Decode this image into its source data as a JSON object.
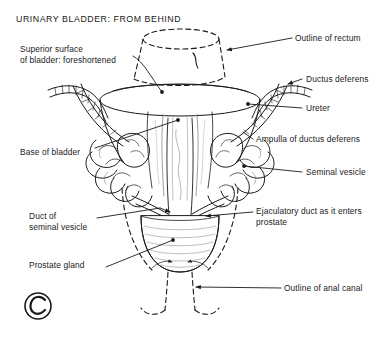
{
  "figure": {
    "title": "URINARY BLADDER: FROM BEHIND",
    "plate_mark": "C",
    "background_color": "#ffffff",
    "ink_color": "#1a1a1a",
    "labels_left": [
      {
        "name": "superior-surface",
        "text": "Superior surface\nof bladder: foreshortened",
        "x": 20,
        "y": 44
      },
      {
        "name": "base-of-bladder",
        "text": "Base of bladder",
        "x": 20,
        "y": 147
      },
      {
        "name": "duct-of-seminal-vesicle",
        "text": "Duct of\nseminal vesicle",
        "x": 29,
        "y": 211
      },
      {
        "name": "prostate-gland",
        "text": "Prostate gland",
        "x": 29,
        "y": 265
      }
    ],
    "labels_right": [
      {
        "name": "outline-of-rectum",
        "text": "Outline of rectum",
        "x": 295,
        "y": 34
      },
      {
        "name": "ductus-deferens",
        "text": "Ductus deferens",
        "x": 305,
        "y": 76
      },
      {
        "name": "ureter",
        "text": "Ureter",
        "x": 305,
        "y": 105
      },
      {
        "name": "ampulla-of-ductus-deferens",
        "text": "Ampulla of ductus deferens",
        "x": 256,
        "y": 136
      },
      {
        "name": "seminal-vesicle",
        "text": "Seminal vesicle",
        "x": 305,
        "y": 170
      },
      {
        "name": "ejaculatory-duct",
        "text": "Ejaculatory duct as it enters\nprostate",
        "x": 256,
        "y": 209
      },
      {
        "name": "outline-of-anal-canal",
        "text": "Outline of anal canal",
        "x": 284,
        "y": 285
      }
    ],
    "structures": [
      "rectum-outline-dashed",
      "bladder-superior-surface",
      "bladder-base",
      "ureter-left",
      "ureter-right",
      "ductus-deferens-left",
      "ductus-deferens-right",
      "ampulla-left",
      "ampulla-right",
      "seminal-vesicle-left",
      "seminal-vesicle-right",
      "ejaculatory-duct-left",
      "ejaculatory-duct-right",
      "prostate-gland",
      "anal-canal-outline-dashed"
    ]
  }
}
